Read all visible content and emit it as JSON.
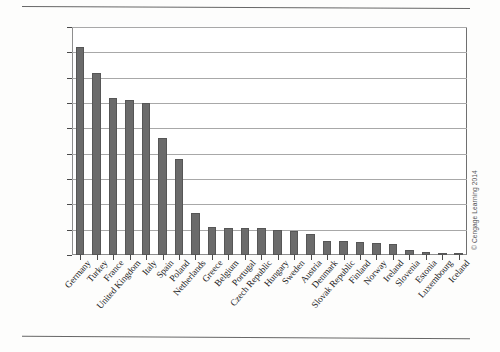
{
  "figure": {
    "credit": "© Cengage Learning 2014"
  },
  "chart_data": {
    "type": "bar",
    "title": "",
    "xlabel": "",
    "ylabel": "",
    "ylim": [
      0,
      90000000
    ],
    "ytick_step": 10000000,
    "grid": true,
    "legend": "none",
    "orientation": "vertical",
    "bar_color": "#6b6b6b",
    "ytick_labels": [
      "0",
      "10,000,000",
      "20,000,000",
      "30,000,000",
      "40,000,000",
      "50,000,000",
      "60,000,000",
      "70,000,000",
      "80,000,000",
      "90,000,000"
    ],
    "yticks": [
      0,
      10000000,
      20000000,
      30000000,
      40000000,
      50000000,
      60000000,
      70000000,
      80000000,
      90000000
    ],
    "categories": [
      "Germany",
      "Turkey",
      "France",
      "United Kingdom",
      "Italy",
      "Spain",
      "Poland",
      "Netherlands",
      "Greece",
      "Belgium",
      "Portugal",
      "Czech Republic",
      "Hungary",
      "Sweden",
      "Austria",
      "Denmark",
      "Slovak Republic",
      "Finland",
      "Norway",
      "Ireland",
      "Slovenia",
      "Estonia",
      "Luxembourg",
      "Iceland"
    ],
    "values": [
      82000000,
      72000000,
      62000000,
      61000000,
      60000000,
      46000000,
      38000000,
      16500000,
      11200000,
      10800000,
      10600000,
      10500000,
      10000000,
      9300000,
      8400000,
      5500000,
      5400000,
      5300000,
      4800000,
      4500000,
      2000000,
      1300000,
      500000,
      320000
    ]
  }
}
